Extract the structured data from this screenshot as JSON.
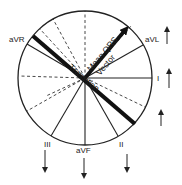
{
  "diagram": {
    "type": "hexaxial-reference-circle",
    "center": [
      85,
      78
    ],
    "radius": 67,
    "colors": {
      "stroke": "#222222",
      "background": "#ffffff"
    },
    "lead_labels": [
      {
        "id": "aVR",
        "text": "aVR",
        "x": 9,
        "y": 42
      },
      {
        "id": "aVL",
        "text": "aVL",
        "x": 145,
        "y": 42
      },
      {
        "id": "I",
        "text": "I",
        "x": 157,
        "y": 81
      },
      {
        "id": "III",
        "text": "III",
        "x": 44,
        "y": 147
      },
      {
        "id": "aVF",
        "text": "aVF",
        "x": 76,
        "y": 153
      },
      {
        "id": "II",
        "text": "II",
        "x": 119,
        "y": 147
      }
    ],
    "solid_axes": [
      {
        "lead": "I",
        "x2": 152,
        "y2": 78
      },
      {
        "lead": "aVL",
        "x2": 143,
        "y2": 45
      },
      {
        "lead": "II",
        "x2": 118,
        "y2": 136
      },
      {
        "lead": "aVF",
        "x2": 85,
        "y2": 145
      },
      {
        "lead": "III",
        "x2": 51,
        "y2": 136
      },
      {
        "lead": "aVR",
        "x2": 27,
        "y2": 44
      }
    ],
    "dashed_axes": [
      {
        "x2": 85,
        "y2": 11
      },
      {
        "x2": 53,
        "y2": 19
      },
      {
        "x2": 40,
        "y2": 29
      },
      {
        "x2": 19,
        "y2": 76
      },
      {
        "x2": 27,
        "y2": 111
      },
      {
        "x2": 46,
        "y2": 96
      },
      {
        "x2": 145,
        "y2": 107
      },
      {
        "x2": 131,
        "y2": 26
      }
    ],
    "transition_line": {
      "x1": 33,
      "y1": 36,
      "x2": 135,
      "y2": 124,
      "label": "Transition"
    },
    "mean_vector": {
      "x1": 85,
      "y1": 78,
      "x2": 126,
      "y2": 29,
      "label_line1": "Mean QRS",
      "label_line2": "Vector"
    },
    "deflection_arrows": [
      {
        "lead": "aVL",
        "direction": "up",
        "x": 167,
        "y1": 44,
        "y2": 29
      },
      {
        "lead": "I",
        "direction": "up",
        "x": 169,
        "y1": 88,
        "y2": 71
      },
      {
        "lead": "lateral",
        "direction": "up",
        "x": 161,
        "y1": 126,
        "y2": 112
      },
      {
        "lead": "III",
        "direction": "down",
        "x": 45,
        "y1": 150,
        "y2": 170
      },
      {
        "lead": "aVF",
        "direction": "down",
        "x": 84,
        "y1": 158,
        "y2": 176
      },
      {
        "lead": "II",
        "direction": "down",
        "x": 127,
        "y1": 154,
        "y2": 170
      }
    ]
  }
}
